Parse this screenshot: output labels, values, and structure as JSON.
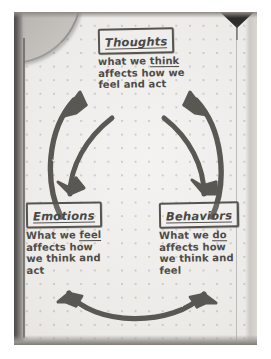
{
  "diagram": {
    "medium": "hand-drawn pencil on dotted notebook paper",
    "ink_color": "#4e4c48",
    "paper_color": "#eceae7",
    "nodes": [
      {
        "id": "thoughts",
        "label": "Thoughts",
        "label_boxed": true,
        "body_line1_pre": "what we ",
        "body_line1_underlined": "think",
        "body_line2": "affects how we",
        "body_line3": "feel and act"
      },
      {
        "id": "emotions",
        "label": "Emotions",
        "label_boxed": true,
        "body_line1_pre": "What we ",
        "body_line1_underlined": "feel",
        "body_line2": "affects how",
        "body_line3": "we think and",
        "body_line4": "act"
      },
      {
        "id": "behaviors",
        "label": "Behaviors",
        "label_boxed": true,
        "body_line1_pre": "What we ",
        "body_line1_underlined": "do",
        "body_line2": "affects how",
        "body_line3": "we think and",
        "body_line4": "feel"
      }
    ],
    "arrows": [
      {
        "id": "arrow-emotions-to-thoughts",
        "from": "emotions",
        "to": "thoughts",
        "shape": "curved-arc-left"
      },
      {
        "id": "arrow-behaviors-to-thoughts",
        "from": "behaviors",
        "to": "thoughts",
        "shape": "curved-arc-right"
      },
      {
        "id": "arrow-thoughts-to-emotions",
        "from": "thoughts",
        "to": "emotions",
        "shape": "curved-arc-left-down"
      },
      {
        "id": "arrow-thoughts-to-behaviors",
        "from": "thoughts",
        "to": "behaviors",
        "shape": "curved-arc-right-down"
      },
      {
        "id": "arrow-behaviors-to-emotions",
        "from": "behaviors",
        "to": "emotions",
        "shape": "curved-arc-bottom"
      },
      {
        "id": "arrow-emotions-to-behaviors",
        "from": "emotions",
        "to": "behaviors",
        "shape": "curved-arc-bottom"
      }
    ],
    "page_features": [
      {
        "id": "dot-grid",
        "description": "faint dotted grid"
      },
      {
        "id": "spine-shadow",
        "description": "dark notebook gutter shadow along left edge"
      },
      {
        "id": "page-curl",
        "description": "curved edge of facing page at top-left"
      },
      {
        "id": "clip-wedge",
        "description": "dark triangular clip shadow at top-right"
      },
      {
        "id": "right-margin-rule",
        "description": "faint vertical rule near right edge"
      }
    ]
  }
}
